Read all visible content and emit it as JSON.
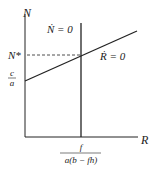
{
  "diagram": {
    "type": "phase-plane",
    "axes": {
      "y_label": "N",
      "x_label": "R"
    },
    "nullclines": [
      {
        "name": "N-dot nullcline",
        "label": "Ṅ = 0",
        "orientation": "vertical"
      },
      {
        "name": "R-dot nullcline",
        "label": "Ṙ = 0",
        "orientation": "sloped"
      }
    ],
    "equilibrium": {
      "y_label": "N*"
    },
    "y_intercept": {
      "numerator": "c",
      "denominator": "a"
    },
    "x_intercept": {
      "numerator": "f",
      "denominator": "a(b − fh)"
    },
    "colors": {
      "line": "#222222",
      "background": "#ffffff"
    }
  }
}
